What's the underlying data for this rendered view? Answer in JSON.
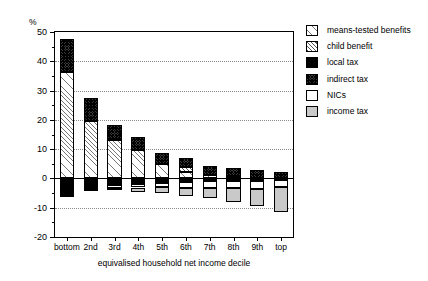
{
  "chart_data": {
    "type": "bar",
    "stacked": true,
    "title": "",
    "xlabel": "equivalised household net income decile",
    "ylabel": "%",
    "yunit": "%",
    "categories": [
      "bottom",
      "2nd",
      "3rd",
      "4th",
      "5th",
      "6th",
      "7th",
      "8th",
      "9th",
      "top"
    ],
    "ylim": [
      -20,
      50
    ],
    "yticks": [
      -20,
      -10,
      0,
      10,
      20,
      30,
      40,
      50
    ],
    "ytick_labels": [
      "-20",
      "-10",
      "0",
      "10",
      "20",
      "30",
      "40",
      "50"
    ],
    "grid": "horizontal-dotted",
    "legend_position": "right",
    "series": [
      {
        "name": "means-tested benefits",
        "pattern": "light-diagonal-hatch",
        "values": [
          36.5,
          19.5,
          13.2,
          9.8,
          5.0,
          2.3,
          1.2,
          0.6,
          0.3,
          0.0
        ]
      },
      {
        "name": "child benefit",
        "pattern": "diagonal-hatch",
        "values": [
          0.0,
          0.0,
          0.0,
          0.0,
          0.0,
          1.5,
          0.0,
          0.0,
          0.0,
          0.0
        ]
      },
      {
        "name": "local tax",
        "pattern": "solid-black",
        "values": [
          -5.0,
          -3.0,
          -2.1,
          -1.8,
          -1.4,
          -1.2,
          -1.0,
          -0.9,
          -0.8,
          -0.6
        ]
      },
      {
        "name": "indirect tax",
        "pattern": "dark-crosshatch",
        "values": [
          11.0,
          7.8,
          5.0,
          4.2,
          3.6,
          3.2,
          3.0,
          2.9,
          2.6,
          2.3
        ]
      },
      {
        "name": "NICs",
        "pattern": "white",
        "values": [
          -0.6,
          -0.7,
          -1.0,
          -1.3,
          -1.6,
          -1.9,
          -2.2,
          -2.5,
          -2.7,
          -2.2
        ]
      },
      {
        "name": "income tax",
        "pattern": "grey-stipple",
        "values": [
          -0.4,
          -0.6,
          -1.0,
          -1.5,
          -2.1,
          -2.8,
          -3.6,
          -4.6,
          -5.8,
          -8.6
        ]
      }
    ],
    "totals": [
      47.5,
      27.4,
      19.2,
      15.6,
      10.0,
      6.6,
      5.0,
      3.9,
      3.0,
      -11.0
    ],
    "positive_totals": [
      47.5,
      27.3,
      18.2,
      14.0,
      8.6,
      7.0,
      4.2,
      3.5,
      2.9,
      2.3
    ],
    "negative_totals": [
      -6.0,
      -4.3,
      -4.1,
      -4.6,
      -5.1,
      -5.9,
      -6.8,
      -8.0,
      -9.3,
      -11.4
    ]
  },
  "legend": {
    "items": [
      {
        "label": "means-tested benefits",
        "pattern": "p-means"
      },
      {
        "label": "child benefit",
        "pattern": "p-child"
      },
      {
        "label": "local tax",
        "pattern": "p-local"
      },
      {
        "label": "indirect tax",
        "pattern": "p-indirect"
      },
      {
        "label": "NICs",
        "pattern": "p-nics"
      },
      {
        "label": "income tax",
        "pattern": "p-income"
      }
    ]
  }
}
